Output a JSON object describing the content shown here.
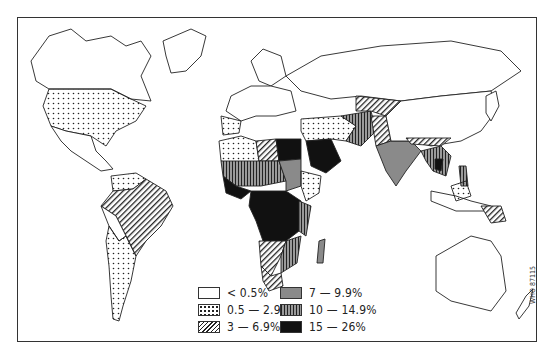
{
  "map": {
    "subject": "World map by country, prevalence categories",
    "reference_code": "WHO 87115"
  },
  "legend": {
    "items": [
      {
        "label": "< 0.5%",
        "pattern": "white",
        "color": "#ffffff"
      },
      {
        "label": "0.5 — 2.9%",
        "pattern": "dots",
        "color": "#ffffff"
      },
      {
        "label": "3 — 6.9%",
        "pattern": "diagonal-hatch",
        "color": "#222222"
      },
      {
        "label": "7 — 9.9%",
        "pattern": "grey",
        "color": "#8a8a8a"
      },
      {
        "label": "10 — 14.9%",
        "pattern": "vertical-hatch",
        "color": "#9a9a9a"
      },
      {
        "label": "15 — 26%",
        "pattern": "black",
        "color": "#111111"
      }
    ]
  },
  "regions": {
    "north_america": {
      "usa": "0.5 — 2.9%",
      "canada": "< 0.5%",
      "mexico": "< 0.5%"
    },
    "south_america": {
      "brazil": "3 — 6.9%",
      "argentina": "0.5 — 2.9%",
      "venezuela": "0.5 — 2.9%"
    },
    "africa": {
      "central": "15 — 26%",
      "north": "7 — 9.9%",
      "east": "10 — 14.9%"
    },
    "asia": {
      "india": "7 — 9.9%",
      "china": "< 0.5%",
      "southeast_asia": "10 — 14.9%"
    },
    "oceania": {
      "australia": "< 0.5%",
      "papua_new_guinea": "3 — 6.9%"
    }
  }
}
